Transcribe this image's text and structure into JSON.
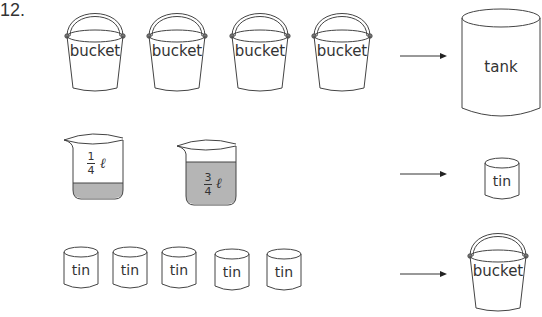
{
  "question_number": "12.",
  "rows": [
    {
      "left_items": [
        {
          "type": "bucket",
          "label": "bucket"
        },
        {
          "type": "bucket",
          "label": "bucket"
        },
        {
          "type": "bucket",
          "label": "bucket"
        },
        {
          "type": "bucket",
          "label": "bucket"
        }
      ],
      "arrow": "arrow-right",
      "right_item": {
        "type": "tank",
        "label": "tank"
      }
    },
    {
      "left_items": [
        {
          "type": "beaker",
          "numerator": "1",
          "denominator": "4",
          "unit": "ℓ",
          "fill_fraction": 0.25
        },
        {
          "type": "beaker",
          "numerator": "3",
          "denominator": "4",
          "unit": "ℓ",
          "fill_fraction": 0.75
        }
      ],
      "arrow": "arrow-right",
      "right_item": {
        "type": "tin",
        "label": "tin"
      }
    },
    {
      "left_items": [
        {
          "type": "tin",
          "label": "tin"
        },
        {
          "type": "tin",
          "label": "tin"
        },
        {
          "type": "tin",
          "label": "tin"
        },
        {
          "type": "tin",
          "label": "tin"
        },
        {
          "type": "tin",
          "label": "tin"
        }
      ],
      "arrow": "arrow-right",
      "right_item": {
        "type": "bucket",
        "label": "bucket"
      }
    }
  ],
  "colors": {
    "line": "#444444",
    "liquid": "#b5b5b5"
  }
}
